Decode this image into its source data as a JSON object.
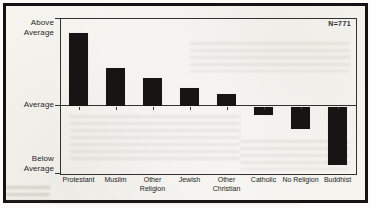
{
  "figure": {
    "annotation": "N=771",
    "colors": {
      "bar": "#171513",
      "axis_line": "#32322f",
      "text": "#232326",
      "paper": "#f6f4ef",
      "border": "#131313"
    }
  },
  "chart_data": {
    "type": "bar",
    "title": "",
    "xlabel": "",
    "ylabel": "",
    "categories": [
      "Protestant",
      "Muslim",
      "Other Religion",
      "Jewish",
      "Other Christian",
      "Catholic",
      "No Religion",
      "Buddhist"
    ],
    "values": [
      73,
      38,
      28,
      18,
      12,
      -8,
      -22,
      -58
    ],
    "units": "relative deviation from sample average (axis has no numeric scale)",
    "category_label_lines": [
      [
        "Protestant"
      ],
      [
        "Muslim"
      ],
      [
        "Other",
        "Religion"
      ],
      [
        "Jewish"
      ],
      [
        "Other",
        "Christian"
      ],
      [
        "Catholic"
      ],
      [
        "No Religion"
      ],
      [
        "Buddhist"
      ]
    ],
    "ytick_labels": [
      [
        "Above",
        "Average"
      ],
      [
        "Average"
      ],
      [
        "Below",
        "Average"
      ]
    ],
    "baseline_label": "Average",
    "ylim": [
      -68,
      88
    ],
    "annotation": "N=771",
    "grid": false,
    "legend_position": "none"
  }
}
